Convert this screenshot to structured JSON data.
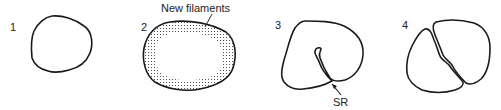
{
  "diagram": {
    "panels": [
      {
        "number": "1",
        "description": "single round cell outline"
      },
      {
        "number": "2",
        "description": "cell with stippled peripheral ring",
        "annotation": "New filaments"
      },
      {
        "number": "3",
        "description": "cell with ingrowing cleft",
        "annotation": "SR"
      },
      {
        "number": "4",
        "description": "cell divided into two halves"
      }
    ],
    "colors": {
      "stroke": "#1a1a1a",
      "background": "#ffffff",
      "stipple": "#333333"
    }
  }
}
